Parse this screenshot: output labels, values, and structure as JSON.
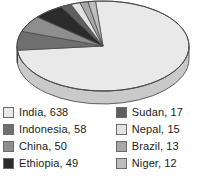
{
  "chart_data": {
    "type": "pie",
    "title": "",
    "subtitle": "",
    "xlabel": "",
    "ylabel": "",
    "grid": false,
    "legend_position": "bottom",
    "three_d": true,
    "categories": [
      "India",
      "Indonesia",
      "China",
      "Ethiopia",
      "Sudan",
      "Nepal",
      "Brazil",
      "Niger"
    ],
    "values": [
      638,
      58,
      50,
      49,
      17,
      15,
      13,
      12
    ],
    "total": 852,
    "slices": [
      {
        "label": "India",
        "value": 638,
        "legend_text": "India, 638",
        "color": "#e9e9e9",
        "side_color": "#c9c9c9"
      },
      {
        "label": "Indonesia",
        "value": 58,
        "legend_text": "Indonesia, 58",
        "color": "#6f6f6f",
        "side_color": "#585858"
      },
      {
        "label": "China",
        "value": 50,
        "legend_text": "China, 50",
        "color": "#8e8e8e",
        "side_color": "#727272"
      },
      {
        "label": "Ethiopia",
        "value": 49,
        "legend_text": "Ethiopia, 49",
        "color": "#2b2b2b",
        "side_color": "#1e1e1e"
      },
      {
        "label": "Sudan",
        "value": 17,
        "legend_text": "Sudan, 17",
        "color": "#5e5e5e",
        "side_color": "#4a4a4a"
      },
      {
        "label": "Nepal",
        "value": 15,
        "legend_text": "Nepal, 15",
        "color": "#e2e2e2",
        "side_color": "#c2c2c2"
      },
      {
        "label": "Brazil",
        "value": 13,
        "legend_text": "Brazil, 13",
        "color": "#a8a8a8",
        "side_color": "#8a8a8a"
      },
      {
        "label": "Niger",
        "value": 12,
        "legend_text": "Niger, 12",
        "color": "#bdbdbd",
        "side_color": "#9c9c9c"
      }
    ]
  },
  "legend": {
    "columns": [
      {
        "items": [
          {
            "text": "India, 638",
            "color": "#e9e9e9",
            "name": "legend-item-india"
          },
          {
            "text": "Indonesia, 58",
            "color": "#6f6f6f",
            "name": "legend-item-indonesia"
          },
          {
            "text": "China, 50",
            "color": "#8e8e8e",
            "name": "legend-item-china"
          },
          {
            "text": "Ethiopia, 49",
            "color": "#2b2b2b",
            "name": "legend-item-ethiopia"
          }
        ]
      },
      {
        "items": [
          {
            "text": "Sudan, 17",
            "color": "#5e5e5e",
            "name": "legend-item-sudan"
          },
          {
            "text": "Nepal, 15",
            "color": "#e2e2e2",
            "name": "legend-item-nepal"
          },
          {
            "text": "Brazil, 13",
            "color": "#a8a8a8",
            "name": "legend-item-brazil"
          },
          {
            "text": "Niger, 12",
            "color": "#bdbdbd",
            "name": "legend-item-niger"
          }
        ]
      }
    ]
  }
}
